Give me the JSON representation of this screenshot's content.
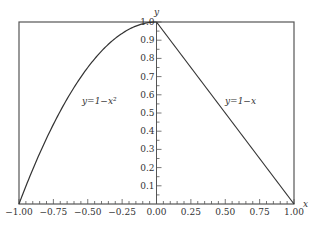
{
  "chart_data": {
    "type": "line",
    "title": "",
    "xlabel": "x",
    "ylabel": "y",
    "xlim": [
      -1.0,
      1.0
    ],
    "ylim": [
      0.0,
      1.0
    ],
    "x_ticks": [
      "-1.00",
      "-0.75",
      "-0.50",
      "-0.25",
      "0.00",
      "0.25",
      "0.50",
      "0.75",
      "1.00"
    ],
    "y_ticks": [
      "0.1",
      "0.2",
      "0.3",
      "0.4",
      "0.5",
      "0.6",
      "0.7",
      "0.8",
      "0.9",
      "1.0"
    ],
    "grid": false,
    "legend": null,
    "series": [
      {
        "name": "y=1-x²",
        "domain": [
          -1.0,
          0.0
        ],
        "x": [
          -1.0,
          -0.9,
          -0.8,
          -0.7,
          -0.6,
          -0.5,
          -0.4,
          -0.3,
          -0.2,
          -0.1,
          0.0
        ],
        "y": [
          0.0,
          0.19,
          0.36,
          0.51,
          0.64,
          0.75,
          0.84,
          0.91,
          0.96,
          0.99,
          1.0
        ]
      },
      {
        "name": "y=1-x",
        "domain": [
          0.0,
          1.0
        ],
        "x": [
          0.0,
          1.0
        ],
        "y": [
          1.0,
          0.0
        ]
      }
    ],
    "annotations": [
      {
        "text": "y=1−x²",
        "x": -0.55,
        "y": 0.63
      },
      {
        "text": "y=1−x",
        "x": 0.55,
        "y": 0.63
      }
    ]
  },
  "labels": {
    "x_axis": "x",
    "y_axis": "y",
    "curve_left": "y=1−x²",
    "curve_right": "y=1−x"
  }
}
